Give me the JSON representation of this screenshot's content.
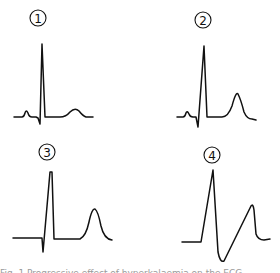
{
  "figure": {
    "panels": [
      {
        "label": "1",
        "description": "Normal ECG complex with small T wave"
      },
      {
        "label": "2",
        "description": "ECG complex with taller peaked T wave"
      },
      {
        "label": "3",
        "description": "ECG complex with absent P wave and tall T wave"
      },
      {
        "label": "4",
        "description": "Widened QRS merging into T wave (sine-wave pattern)"
      }
    ],
    "caption": "Fig. 1  Progressive effect of hyperkalaemia on the ECG"
  },
  "colors": {
    "ink": "#111111",
    "background": "#ffffff"
  }
}
